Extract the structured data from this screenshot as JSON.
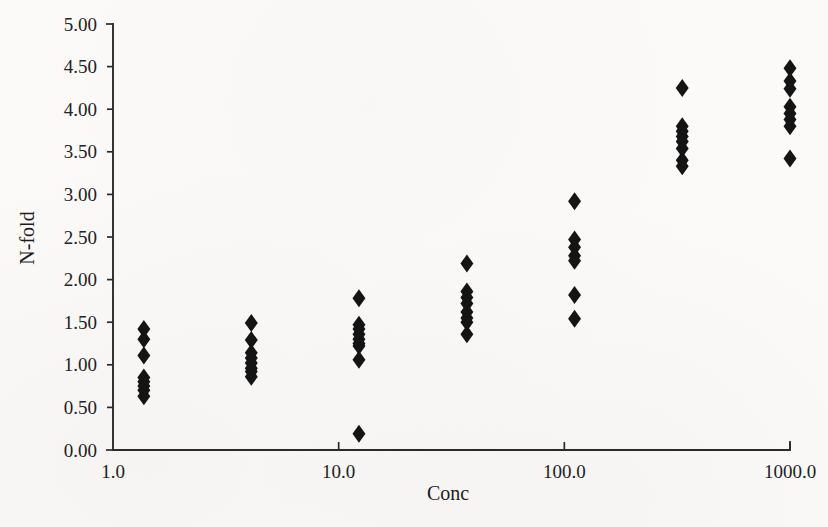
{
  "chart_data": {
    "type": "scatter",
    "title": "",
    "xlabel": "Conc",
    "ylabel": "N-fold",
    "xscale": "log",
    "yscale": "linear",
    "xlim": [
      1.0,
      1000.0
    ],
    "ylim": [
      0.0,
      5.0
    ],
    "grid": false,
    "legend": null,
    "xticks": [
      {
        "value": 1.0,
        "label": "1.0"
      },
      {
        "value": 10.0,
        "label": "10.0"
      },
      {
        "value": 100.0,
        "label": "100.0"
      },
      {
        "value": 1000.0,
        "label": "1000.0"
      }
    ],
    "yticks": [
      {
        "value": 0.0,
        "label": "0.00"
      },
      {
        "value": 0.5,
        "label": "0.50"
      },
      {
        "value": 1.0,
        "label": "1.00"
      },
      {
        "value": 1.5,
        "label": "1.50"
      },
      {
        "value": 2.0,
        "label": "2.00"
      },
      {
        "value": 2.5,
        "label": "2.50"
      },
      {
        "value": 3.0,
        "label": "3.00"
      },
      {
        "value": 3.5,
        "label": "3.50"
      },
      {
        "value": 4.0,
        "label": "4.00"
      },
      {
        "value": 4.5,
        "label": "4.50"
      },
      {
        "value": 5.0,
        "label": "5.00"
      }
    ],
    "marker": {
      "shape": "diamond",
      "color": "#141414",
      "size": 9
    },
    "series": [
      {
        "name": "N-fold response",
        "points": [
          {
            "x": 1.37,
            "y": 1.42
          },
          {
            "x": 1.37,
            "y": 1.3
          },
          {
            "x": 1.37,
            "y": 1.11
          },
          {
            "x": 1.37,
            "y": 0.85
          },
          {
            "x": 1.37,
            "y": 0.8
          },
          {
            "x": 1.37,
            "y": 0.75
          },
          {
            "x": 1.37,
            "y": 0.7
          },
          {
            "x": 1.37,
            "y": 0.63
          },
          {
            "x": 4.1,
            "y": 1.49
          },
          {
            "x": 4.1,
            "y": 1.29
          },
          {
            "x": 4.1,
            "y": 1.14
          },
          {
            "x": 4.1,
            "y": 1.08
          },
          {
            "x": 4.1,
            "y": 1.02
          },
          {
            "x": 4.1,
            "y": 0.96
          },
          {
            "x": 4.1,
            "y": 0.92
          },
          {
            "x": 4.1,
            "y": 0.86
          },
          {
            "x": 12.3,
            "y": 1.78
          },
          {
            "x": 12.3,
            "y": 1.47
          },
          {
            "x": 12.3,
            "y": 1.42
          },
          {
            "x": 12.3,
            "y": 1.36
          },
          {
            "x": 12.3,
            "y": 1.3
          },
          {
            "x": 12.3,
            "y": 1.25
          },
          {
            "x": 12.3,
            "y": 1.22
          },
          {
            "x": 12.3,
            "y": 1.06
          },
          {
            "x": 12.3,
            "y": 0.19
          },
          {
            "x": 37.0,
            "y": 2.19
          },
          {
            "x": 37.0,
            "y": 1.86
          },
          {
            "x": 37.0,
            "y": 1.79
          },
          {
            "x": 37.0,
            "y": 1.72
          },
          {
            "x": 37.0,
            "y": 1.62
          },
          {
            "x": 37.0,
            "y": 1.55
          },
          {
            "x": 37.0,
            "y": 1.5
          },
          {
            "x": 37.0,
            "y": 1.36
          },
          {
            "x": 111.0,
            "y": 2.92
          },
          {
            "x": 111.0,
            "y": 2.47
          },
          {
            "x": 111.0,
            "y": 2.38
          },
          {
            "x": 111.0,
            "y": 2.28
          },
          {
            "x": 111.0,
            "y": 2.22
          },
          {
            "x": 111.0,
            "y": 1.82
          },
          {
            "x": 111.0,
            "y": 1.54
          },
          {
            "x": 333.0,
            "y": 4.25
          },
          {
            "x": 333.0,
            "y": 3.8
          },
          {
            "x": 333.0,
            "y": 3.74
          },
          {
            "x": 333.0,
            "y": 3.68
          },
          {
            "x": 333.0,
            "y": 3.62
          },
          {
            "x": 333.0,
            "y": 3.54
          },
          {
            "x": 333.0,
            "y": 3.4
          },
          {
            "x": 333.0,
            "y": 3.33
          },
          {
            "x": 1000.0,
            "y": 4.48
          },
          {
            "x": 1000.0,
            "y": 4.33
          },
          {
            "x": 1000.0,
            "y": 4.24
          },
          {
            "x": 1000.0,
            "y": 4.03
          },
          {
            "x": 1000.0,
            "y": 3.95
          },
          {
            "x": 1000.0,
            "y": 3.88
          },
          {
            "x": 1000.0,
            "y": 3.8
          },
          {
            "x": 1000.0,
            "y": 3.42
          }
        ]
      }
    ]
  }
}
